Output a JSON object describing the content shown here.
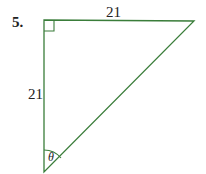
{
  "problem": {
    "number": "5.",
    "top_side_label": "21",
    "left_side_label": "21",
    "angle_label": "θ"
  },
  "style": {
    "line_color": "#3a7d3a"
  }
}
